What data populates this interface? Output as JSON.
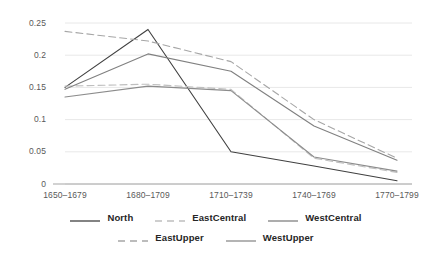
{
  "chart_data": {
    "type": "line",
    "title": "",
    "xlabel": "",
    "ylabel": "",
    "categories": [
      "1650–1679",
      "1680–1709",
      "1710–1739",
      "1740–1769",
      "1770–1799"
    ],
    "ylim": [
      0,
      0.25
    ],
    "yticks": [
      0,
      0.05,
      0.1,
      0.15,
      0.2,
      0.25
    ],
    "ytick_labels": [
      "0",
      "0.05",
      "0.1",
      "0.15",
      "0.2",
      "0.25"
    ],
    "grid": true,
    "grid_axis": "y",
    "legend_position": "bottom",
    "series": [
      {
        "name": "North",
        "color": "#404040",
        "style": "solid",
        "values": [
          0.15,
          0.24,
          0.05,
          0.028,
          0.005
        ]
      },
      {
        "name": "EastCentral",
        "color": "#bfbfbf",
        "style": "dashed",
        "values": [
          0.152,
          0.155,
          0.147,
          0.04,
          0.018
        ]
      },
      {
        "name": "WestCentral",
        "color": "#808080",
        "style": "solid",
        "values": [
          0.147,
          0.202,
          0.175,
          0.09,
          0.037
        ]
      },
      {
        "name": "EastUpper",
        "color": "#a6a6a6",
        "style": "dashed",
        "values": [
          0.237,
          0.222,
          0.19,
          0.1,
          0.04
        ]
      },
      {
        "name": "WestUpper",
        "color": "#8c8c8c",
        "style": "solid",
        "values": [
          0.135,
          0.152,
          0.145,
          0.042,
          0.02
        ]
      }
    ]
  },
  "axis": {
    "ytick_labels": [
      "0.25",
      "0.2",
      "0.15",
      "0.1",
      "0.05",
      "0"
    ],
    "xtick_labels": [
      "1650–1679",
      "1680–1709",
      "1710–1739",
      "1740–1769",
      "1770–1799"
    ]
  },
  "legend": {
    "row1": [
      {
        "label": "North",
        "color": "#404040",
        "style": "solid"
      },
      {
        "label": "EastCentral",
        "color": "#bfbfbf",
        "style": "dashed"
      },
      {
        "label": "WestCentral",
        "color": "#808080",
        "style": "solid"
      }
    ],
    "row2": [
      {
        "label": "EastUpper",
        "color": "#a6a6a6",
        "style": "dashed"
      },
      {
        "label": "WestUpper",
        "color": "#8c8c8c",
        "style": "solid"
      }
    ]
  },
  "style": {
    "background": "#ffffff",
    "grid_color": "#e8e8e8",
    "axis_color": "#a6a6a6",
    "tick_text_color": "#595959",
    "legend_text_color": "#262626"
  }
}
